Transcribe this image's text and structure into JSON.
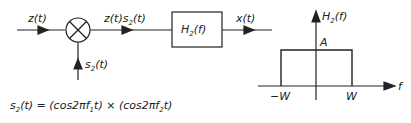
{
  "block_diagram": {
    "input_label": "z(t)",
    "mixer_output_label": "z(t)s2(t)",
    "mixer_reference_label": "s2(t)",
    "filter_label": "H2(f)",
    "output_label": "x(t)"
  },
  "equation": {
    "lhs": "s2(t) =",
    "rhs": "(cos2πf1t) × (cos2πf2t)"
  },
  "frequency_response": {
    "ylabel": "H2(f)",
    "xlabel": "f",
    "amplitude_label": "A",
    "neg_cutoff_label": "−W",
    "pos_cutoff_label": "W"
  },
  "colors": {
    "ink": "#222222",
    "background": "#ffffff"
  }
}
